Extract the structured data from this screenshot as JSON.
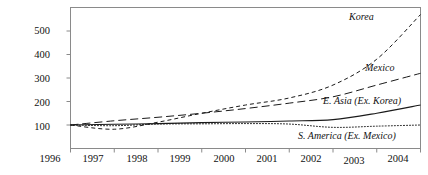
{
  "chart_data": {
    "type": "line",
    "title": "",
    "xlabel": "",
    "ylabel": "",
    "x": [
      1996,
      1997,
      1998,
      1999,
      2000,
      2001,
      2002,
      2003,
      2004
    ],
    "xlim": [
      1996,
      2004
    ],
    "ylim": [
      0,
      600
    ],
    "yticks": [
      100,
      200,
      300,
      400,
      500
    ],
    "xticks": [
      1996,
      1997,
      1998,
      1999,
      2000,
      2001,
      2002,
      2003,
      2004
    ],
    "grid": false,
    "legend_position": "inline-labels",
    "series": [
      {
        "name": "Korea",
        "linestyle": "short-dash",
        "color": "#1a1a1a",
        "values": [
          100,
          82,
          112,
          150,
          185,
          215,
          270,
          380,
          570
        ],
        "label": "Korea"
      },
      {
        "name": "Mexico",
        "linestyle": "long-dash",
        "color": "#1a1a1a",
        "values": [
          100,
          118,
          133,
          150,
          170,
          193,
          220,
          270,
          320
        ],
        "label": "Mexico"
      },
      {
        "name": "E. Asia (Ex. Korea)",
        "linestyle": "solid",
        "color": "#1a1a1a",
        "values": [
          100,
          103,
          106,
          110,
          113,
          117,
          123,
          150,
          185
        ],
        "label": "E. Asia (Ex. Korea)"
      },
      {
        "name": "S. America (Ex. Mexico)",
        "linestyle": "dotted",
        "color": "#1a1a1a",
        "values": [
          100,
          97,
          104,
          105,
          106,
          104,
          90,
          95,
          100
        ],
        "label": "S. America (Ex. Mexico)"
      }
    ],
    "ytick_labels": [
      "100",
      "200",
      "300",
      "400",
      "500"
    ],
    "xtick_labels": [
      "1996",
      "1997",
      "1998",
      "1999",
      "2000",
      "2001",
      "2002",
      "2003",
      "2004"
    ]
  },
  "axis": {
    "y_500": "500",
    "y_400": "400",
    "y_300": "300",
    "y_200": "200",
    "y_100": "100",
    "x_1996": "1996",
    "x_1997": "1997",
    "x_1998": "1998",
    "x_1999": "1999",
    "x_2000": "2000",
    "x_2001": "2001",
    "x_2002": "2002",
    "x_2003": "2003",
    "x_2004": "2004"
  },
  "labels": {
    "korea": "Korea",
    "mexico": "Mexico",
    "east_asia": "E. Asia (Ex. Korea)",
    "south_america": "S. America (Ex. Mexico)"
  },
  "colors": {
    "ink": "#1a1a1a",
    "frame": "#8a8a8a",
    "background": "#ffffff"
  }
}
